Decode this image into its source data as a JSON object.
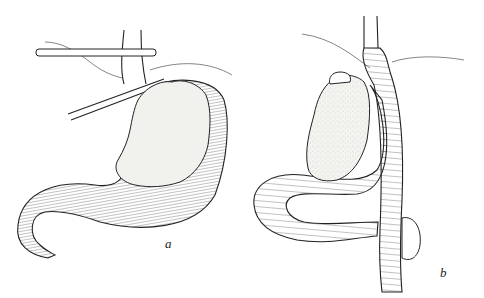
{
  "figure": {
    "panels": [
      {
        "id": "a",
        "label": "a",
        "content": "Stomach with tumor, clamps across proximal stomach/esophagus"
      },
      {
        "id": "b",
        "label": "b",
        "content": "Tumor mass with jejunal limb anastomosed to esophagus"
      }
    ],
    "colors": {
      "background": "#ffffff",
      "ink": "#222222",
      "tumor_fill": "#f1f1ee"
    }
  }
}
